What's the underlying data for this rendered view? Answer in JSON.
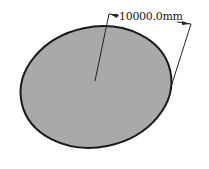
{
  "diagram": {
    "shape": "circle",
    "fill_color": "#a9a9a9",
    "stroke_color": "#1a1a1a",
    "dimension": {
      "label": "10000.0mm",
      "type": "radius"
    }
  }
}
